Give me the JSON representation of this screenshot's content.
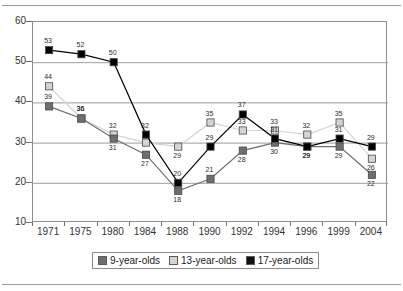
{
  "chart_data": {
    "type": "line",
    "title": "",
    "subtitle": "",
    "xlabel": "",
    "ylabel": "",
    "categories": [
      "1971",
      "1975",
      "1980",
      "1984",
      "1988",
      "1990",
      "1992",
      "1994",
      "1996",
      "1999",
      "2004"
    ],
    "ylim": [
      10,
      60
    ],
    "yticks": [
      "10",
      "20",
      "30",
      "40",
      "50",
      "60"
    ],
    "grid": "horizontal",
    "legend_position": "bottom",
    "series": [
      {
        "name": "9-year-olds",
        "color": "#6e6e6e",
        "values": [
          39,
          36,
          31,
          27,
          18,
          21,
          28,
          30,
          29,
          29,
          22
        ],
        "labels": [
          "39",
          "36",
          "31",
          "27",
          "18",
          "21",
          "28",
          "30",
          "29",
          "29",
          "22"
        ]
      },
      {
        "name": "13-year-olds",
        "color": "#d4d4d4",
        "values": [
          44,
          36,
          32,
          30,
          29,
          35,
          33,
          33,
          32,
          35,
          26
        ],
        "labels": [
          "44",
          "36",
          "32",
          "",
          "29",
          "35",
          "33",
          "33",
          "32",
          "35",
          "26"
        ]
      },
      {
        "name": "17-year-olds",
        "color": "#000000",
        "values": [
          53,
          52,
          50,
          32,
          20,
          29,
          37,
          31,
          29,
          31,
          29
        ],
        "labels": [
          "53",
          "52",
          "50",
          "32",
          "20",
          "29",
          "37",
          "31",
          "29",
          "31",
          "29"
        ]
      }
    ]
  },
  "legend": {
    "items": [
      {
        "label": "9-year-olds",
        "color": "#6e6e6e"
      },
      {
        "label": "13-year-olds",
        "color": "#d4d4d4"
      },
      {
        "label": "17-year-olds",
        "color": "#111111"
      }
    ]
  }
}
